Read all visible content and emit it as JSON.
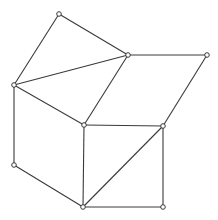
{
  "diagram": {
    "type": "graph",
    "width": 218,
    "height": 220,
    "colors": {
      "background": "#ffffff",
      "edge": "#3a3a3a",
      "node_fill": "#ffffff",
      "node_stroke": "#3a3a3a"
    },
    "node_radius": 2.3,
    "nodes": [
      {
        "id": "A",
        "x": 59,
        "y": 14
      },
      {
        "id": "B",
        "x": 128,
        "y": 55
      },
      {
        "id": "C",
        "x": 14,
        "y": 85
      },
      {
        "id": "D",
        "x": 84,
        "y": 125
      },
      {
        "id": "E",
        "x": 207,
        "y": 55
      },
      {
        "id": "F",
        "x": 163,
        "y": 126
      },
      {
        "id": "G",
        "x": 14,
        "y": 165
      },
      {
        "id": "H",
        "x": 83,
        "y": 207
      },
      {
        "id": "I",
        "x": 163,
        "y": 207
      }
    ],
    "edges": [
      [
        "A",
        "B"
      ],
      [
        "A",
        "C"
      ],
      [
        "C",
        "B"
      ],
      [
        "C",
        "D"
      ],
      [
        "B",
        "D"
      ],
      [
        "B",
        "E"
      ],
      [
        "E",
        "F"
      ],
      [
        "D",
        "F"
      ],
      [
        "C",
        "G"
      ],
      [
        "G",
        "H"
      ],
      [
        "D",
        "H"
      ],
      [
        "H",
        "F"
      ],
      [
        "F",
        "I"
      ],
      [
        "H",
        "I"
      ]
    ]
  }
}
